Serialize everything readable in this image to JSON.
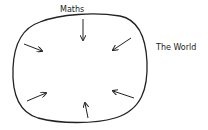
{
  "diagram": {
    "labels": {
      "top": "Maths",
      "outside": "The World"
    },
    "shape": "closed-loop",
    "arrows": [
      {
        "id": "top",
        "direction": "inward"
      },
      {
        "id": "top-right",
        "direction": "inward"
      },
      {
        "id": "bottom-right",
        "direction": "inward"
      },
      {
        "id": "bottom",
        "direction": "inward"
      },
      {
        "id": "bottom-left",
        "direction": "inward"
      },
      {
        "id": "top-left",
        "direction": "inward"
      }
    ],
    "colors": {
      "stroke": "#222222",
      "background": "#ffffff"
    }
  }
}
